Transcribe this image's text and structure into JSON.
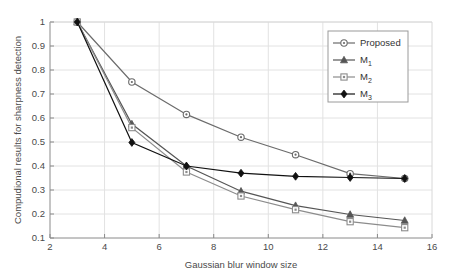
{
  "chart_data": {
    "type": "line",
    "title": "",
    "subtitle": "",
    "xlabel": "Gaussian blur window size",
    "ylabel": "Compudional results for sharpness detection",
    "x": [
      3,
      5,
      7,
      9,
      11,
      13,
      15
    ],
    "xlim": [
      2,
      16
    ],
    "ylim": [
      0.1,
      1
    ],
    "xticks": [
      "2",
      "4",
      "6",
      "8",
      "10",
      "12",
      "14",
      "16"
    ],
    "xtick_values": [
      2,
      4,
      6,
      8,
      10,
      12,
      14,
      16
    ],
    "yticks": [
      "0.1",
      "0.2",
      "0.3",
      "0.4",
      "0.5",
      "0.6",
      "0.7",
      "0.8",
      "0.9",
      "1"
    ],
    "ytick_values": [
      0.1,
      0.2,
      0.3,
      0.4,
      0.5,
      0.6,
      0.7,
      0.8,
      0.9,
      1
    ],
    "grid": true,
    "legend_position": "top-right",
    "series": [
      {
        "name": "Proposed",
        "marker": "circle-open",
        "color": "#6b6b6b",
        "values": [
          1.0,
          0.75,
          0.615,
          0.52,
          0.447,
          0.368,
          0.348
        ]
      },
      {
        "name": "M1",
        "label_base": "M",
        "label_sub": "1",
        "marker": "triangle-filled",
        "color": "#555555",
        "values": [
          1.0,
          0.575,
          0.4,
          0.295,
          0.235,
          0.198,
          0.173
        ]
      },
      {
        "name": "M2",
        "label_base": "M",
        "label_sub": "2",
        "marker": "square-open",
        "color": "#8c8c8c",
        "values": [
          1.0,
          0.56,
          0.375,
          0.275,
          0.218,
          0.168,
          0.143
        ]
      },
      {
        "name": "M3",
        "label_base": "M",
        "label_sub": "3",
        "marker": "diamond-filled",
        "color": "#111111",
        "values": [
          1.0,
          0.498,
          0.4,
          0.37,
          0.357,
          0.352,
          0.348
        ]
      }
    ],
    "colors": {
      "axis": "#8a8a8a",
      "grid": "#e2e2e2",
      "background": "#ffffff",
      "text": "#4a4a4a"
    }
  },
  "legend": {
    "entries": [
      {
        "label": "Proposed",
        "sub": ""
      },
      {
        "label": "M",
        "sub": "1"
      },
      {
        "label": "M",
        "sub": "2"
      },
      {
        "label": "M",
        "sub": "3"
      }
    ]
  }
}
